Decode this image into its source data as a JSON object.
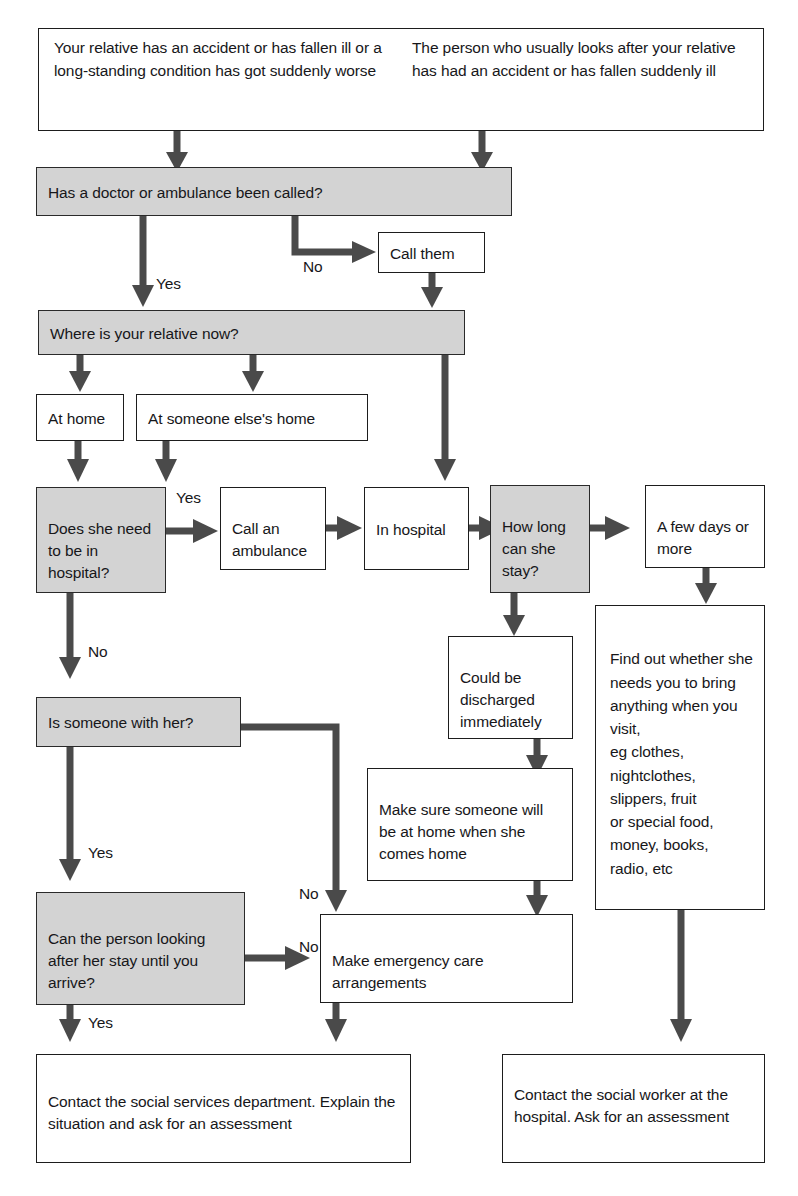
{
  "diagram": {
    "colors": {
      "decision_fill": "#d3d3d3",
      "action_fill": "#ffffff",
      "stroke": "#1d1d1d",
      "connector": "#4a4a4a"
    },
    "nodes": {
      "start_left": "Your relative has an accident or has fallen ill or a long-standing condition has got suddenly worse",
      "start_right": "The person who usually looks after your relative has had an accident or has fallen suddenly ill",
      "doctor_called": "Has a doctor or ambulance been called?",
      "call_them": "Call them",
      "where_now": "Where is your relative now?",
      "at_home": "At home",
      "at_someone_elses_home": "At someone else's home",
      "needs_hospital": "Does she need to be in hospital?",
      "call_ambulance": "Call an ambulance",
      "in_hospital": "In hospital",
      "how_long_stay": "How long can she stay?",
      "a_few_days": "A few days or more",
      "could_be_discharged": "Could be discharged immediately",
      "find_out_whether": "Find out whether she needs you to bring anything when you visit,\neg clothes,\nnightclothes,\nslippers, fruit\nor special food,\nmoney, books,\nradio, etc",
      "is_someone_with_her": "Is someone with her?",
      "make_sure_someone": "Make sure someone will be at home when she comes home",
      "can_person_stay": "Can the person looking after her stay until you arrive?",
      "emergency_care": "Make emergency care arrangements",
      "contact_social_services": "Contact the social services department. Explain the situation and ask for an assessment",
      "contact_social_worker": "Contact the social worker at the hospital. Ask for an assessment"
    },
    "edge_labels": {
      "doctor_yes": "Yes",
      "doctor_no": "No",
      "hospital_yes": "Yes",
      "hospital_no": "No",
      "someone_with_her_yes": "Yes",
      "someone_with_her_no": "No",
      "can_stay_yes": "Yes",
      "can_stay_no": "No"
    }
  }
}
